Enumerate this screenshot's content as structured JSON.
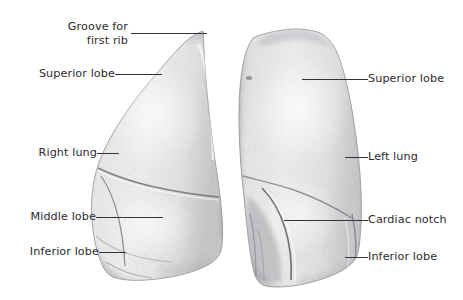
{
  "figure": {
    "background_color": "#ffffff",
    "text_color": "#2b2b2f",
    "leader_color": "#33333a",
    "tissue_color": "#ebebeb",
    "outline_color": "#8d8d92"
  },
  "labels": {
    "groove_for_first_rib_line1": "Groove for",
    "groove_for_first_rib_line2": "first rib",
    "superior_lobe_left": "Superior lobe",
    "right_lung": "Right lung",
    "middle_lobe": "Middle lobe",
    "inferior_lobe_left": "Inferior lobe",
    "superior_lobe_right": "Superior lobe",
    "left_lung": "Left lung",
    "cardiac_notch": "Cardiac notch",
    "inferior_lobe_right": "Inferior lobe"
  },
  "structures": [
    {
      "name": "right-lung",
      "side": "left-of-image",
      "lobes": [
        "Superior lobe",
        "Middle lobe",
        "Inferior lobe"
      ]
    },
    {
      "name": "left-lung",
      "side": "right-of-image",
      "lobes": [
        "Superior lobe",
        "Inferior lobe"
      ],
      "features": [
        "Cardiac notch"
      ]
    }
  ]
}
